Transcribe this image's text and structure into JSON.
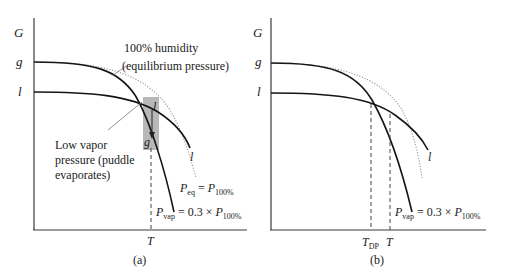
{
  "panels": [
    {
      "id": "a",
      "caption": "(a)",
      "y_axis_label": "G",
      "curve_labels": {
        "g": "g",
        "l": "l"
      },
      "x_tick": "T",
      "annotations": {
        "humidity_line1": "100% humidity",
        "humidity_line2": "(equilibrium pressure)",
        "low_vapor_line1": "Low vapor",
        "low_vapor_line2": "pressure (puddle",
        "low_vapor_line3": "evaporates)",
        "box_top": "l",
        "box_bottom": "g",
        "curve_end_l": "l",
        "peq_P": "P",
        "peq_sub": "eq",
        "peq_eq": " = ",
        "peq_P2": "P",
        "peq_sub2": "100%",
        "pvap_P": "P",
        "pvap_sub": "vap",
        "pvap_eq": " = 0.3 × ",
        "pvap_P2": "P",
        "pvap_sub2": "100%"
      }
    },
    {
      "id": "b",
      "caption": "(b)",
      "y_axis_label": "G",
      "curve_labels": {
        "g": "g",
        "l": "l"
      },
      "x_ticks": {
        "tdp_T": "T",
        "tdp_sub": "DP",
        "t": "T"
      },
      "annotations": {
        "curve_end_l": "l",
        "pvap_P": "P",
        "pvap_sub": "vap",
        "pvap_eq": " = 0.3 × ",
        "pvap_P2": "P",
        "pvap_sub2": "100%"
      }
    }
  ],
  "colors": {
    "curve": "#151515",
    "dotted": "#9a9a9a",
    "highlight_box": "#b8b8b8"
  }
}
